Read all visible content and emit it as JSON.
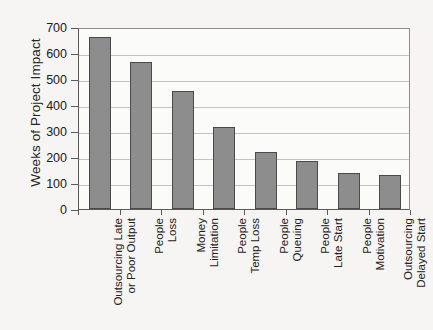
{
  "chart_data": {
    "type": "bar",
    "title": "",
    "xlabel": "",
    "ylabel": "Weeks of Project Impact",
    "ylim": [
      0,
      700
    ],
    "ytick_values": [
      0,
      100,
      200,
      300,
      400,
      500,
      600,
      700
    ],
    "ytick_labels": [
      "0",
      "100",
      "200",
      "300",
      "400",
      "500",
      "600",
      "700"
    ],
    "grid": true,
    "legend": "none",
    "bar_color": "#8d8d8d",
    "bar_edge_color": "#4a4a4a",
    "plot_background": "#fbfbfa",
    "figure_background": "#f6f5f3",
    "categories": [
      "Outsourcing Late or Poor Output",
      "People Loss",
      "Money Limitation",
      "People Temp Loss",
      "People Queuing",
      "People Late Start",
      "People Motivation",
      "Outsourcing Delayed Start"
    ],
    "category_lines": [
      {
        "line1": "Outsourcing Late",
        "line2": "or Poor Output"
      },
      {
        "line1": "People",
        "line2": "Loss"
      },
      {
        "line1": "Money",
        "line2": "Limitation"
      },
      {
        "line1": "People",
        "line2": "Temp Loss"
      },
      {
        "line1": "People",
        "line2": "Queuing"
      },
      {
        "line1": "People",
        "line2": "Late Start"
      },
      {
        "line1": "People",
        "line2": "Motivation"
      },
      {
        "line1": "Outsourcing",
        "line2": "Delayed Start"
      }
    ],
    "values": [
      660,
      565,
      455,
      315,
      220,
      185,
      140,
      130
    ]
  }
}
